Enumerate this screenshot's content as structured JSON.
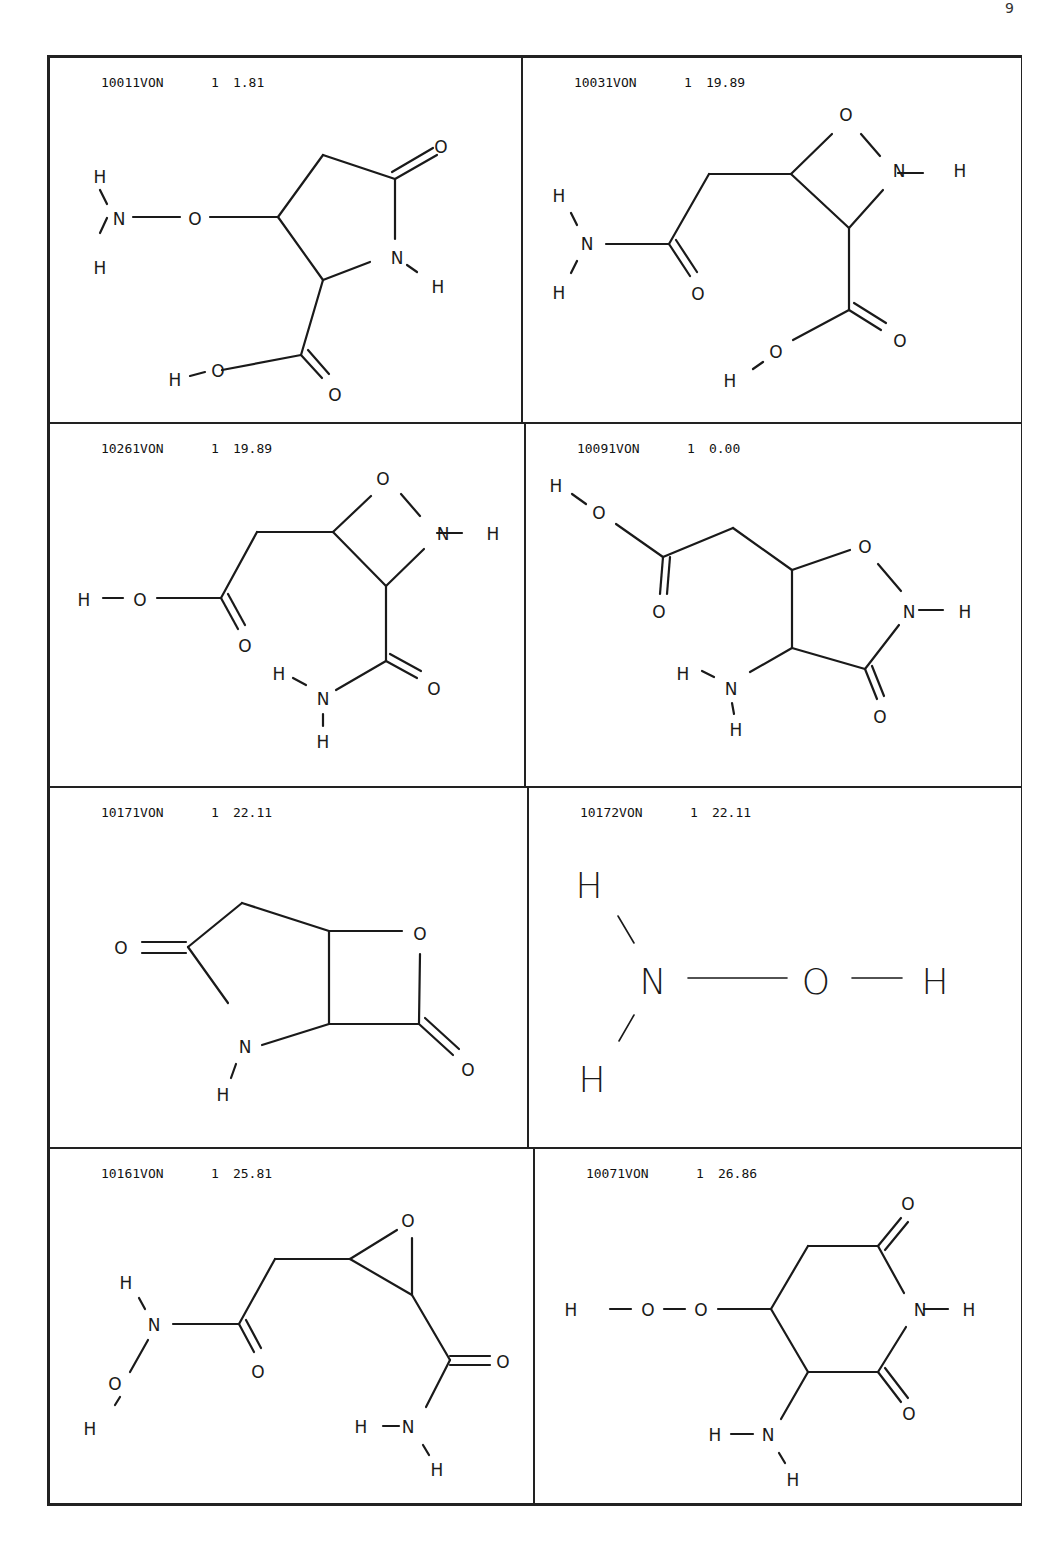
{
  "page": {
    "corner_mark": "9"
  },
  "structures": [
    {
      "id": "10011VON",
      "count": "1",
      "score": "1.81",
      "atoms": {
        "a1": "H",
        "a2": "N",
        "a3": "H",
        "a4": "O",
        "a5": "O",
        "a6": "N",
        "a7": "H",
        "a8": "H",
        "a9": "O",
        "a10": "O"
      }
    },
    {
      "id": "10031VON",
      "count": "1",
      "score": "19.89",
      "atoms": {
        "a1": "O",
        "a2": "N",
        "a3": "H",
        "a4": "H",
        "a5": "N",
        "a6": "H",
        "a7": "O",
        "a8": "O",
        "a9": "H",
        "a10": "O"
      }
    },
    {
      "id": "10261VON",
      "count": "1",
      "score": "19.89",
      "atoms": {
        "a1": "O",
        "a2": "N",
        "a3": "H",
        "a4": "H",
        "a5": "O",
        "a6": "O",
        "a7": "H",
        "a8": "N",
        "a9": "H",
        "a10": "O"
      }
    },
    {
      "id": "10091VON",
      "count": "1",
      "score": "0.00",
      "atoms": {
        "a1": "H",
        "a2": "O",
        "a3": "O",
        "a4": "O",
        "a5": "N",
        "a6": "H",
        "a7": "H",
        "a8": "N",
        "a9": "H",
        "a10": "O"
      }
    },
    {
      "id": "10171VON",
      "count": "1",
      "score": "22.11",
      "atoms": {
        "a1": "O",
        "a2": "O",
        "a3": "N",
        "a4": "H",
        "a5": "O"
      }
    },
    {
      "id": "10172VON",
      "count": "1",
      "score": "22.11",
      "atoms": {
        "a1": "H",
        "a2": "N",
        "a3": "H",
        "a4": "O",
        "a5": "H"
      }
    },
    {
      "id": "10161VON",
      "count": "1",
      "score": "25.81",
      "atoms": {
        "a1": "O",
        "a2": "H",
        "a3": "N",
        "a4": "O",
        "a5": "H",
        "a6": "O",
        "a7": "O",
        "a8": "H",
        "a9": "N",
        "a10": "H"
      }
    },
    {
      "id": "10071VON",
      "count": "1",
      "score": "26.86",
      "atoms": {
        "a1": "O",
        "a2": "H",
        "a3": "O",
        "a4": "O",
        "a5": "N",
        "a6": "H",
        "a7": "O",
        "a8": "H",
        "a9": "N",
        "a10": "H"
      }
    }
  ]
}
